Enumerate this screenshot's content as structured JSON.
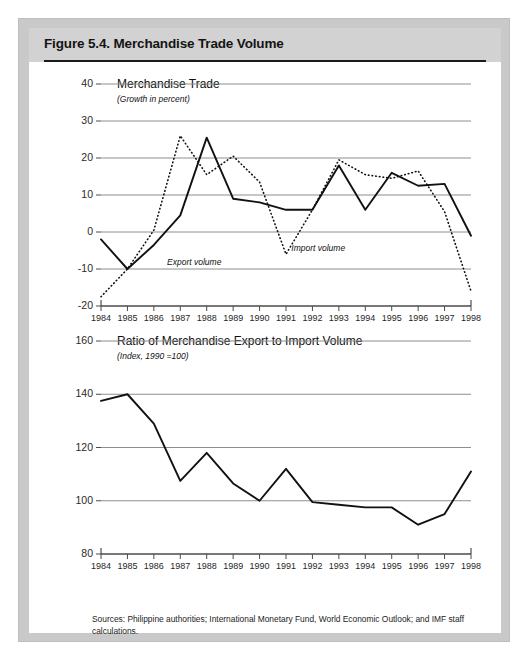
{
  "figure": {
    "title": "Figure 5.4.  Merchandise Trade Volume",
    "source_note": "Sources:  Philippine authorities; International Monetary Fund, World Economic Outlook; and IMF staff calculations."
  },
  "colors": {
    "frame": "#c9c9c9",
    "title_band": "#d2d2d2",
    "gridline": "#8e8e8e",
    "line": "#111111",
    "text": "#141414"
  },
  "chart_data": [
    {
      "type": "line",
      "id": "merchandise-trade",
      "title": "Merchandise Trade",
      "subtitle": "(Growth in percent)",
      "xlabel": "",
      "ylabel": "",
      "ylim": [
        -20,
        40
      ],
      "yticks": [
        40,
        30,
        20,
        10,
        0,
        -10,
        -20
      ],
      "grid": true,
      "legend_position": "inline-annotation",
      "categories": [
        1984,
        1985,
        1986,
        1987,
        1988,
        1989,
        1990,
        1991,
        1992,
        1993,
        1994,
        1995,
        1996,
        1997,
        1998
      ],
      "xtick_labels": [
        "1984",
        "1985",
        "1986",
        "1987",
        "1988",
        "1989",
        "1990",
        "1991",
        "1992",
        "1993",
        "1994",
        "1995",
        "1996",
        "1997",
        "1998"
      ],
      "series": [
        {
          "name": "Export volume",
          "style": "solid",
          "values": [
            -2.0,
            -10.0,
            -3.5,
            4.5,
            25.5,
            9.0,
            8.0,
            6.0,
            6.0,
            18.0,
            6.0,
            16.0,
            12.5,
            13.0,
            -1.0
          ]
        },
        {
          "name": "Import volume",
          "style": "dotted",
          "values": [
            -17.5,
            -10.0,
            0.5,
            26.0,
            15.5,
            20.5,
            13.5,
            -6.0,
            6.0,
            19.5,
            15.5,
            14.5,
            16.5,
            5.5,
            -16.0
          ]
        }
      ],
      "annotations": [
        {
          "text": "Export volume",
          "x": 1986.5,
          "y": -8.5
        },
        {
          "text": "Import volume",
          "x": 1991.2,
          "y": -4.5
        }
      ]
    },
    {
      "type": "line",
      "id": "ratio-export-import",
      "title": "Ratio of Merchandise Export to Import Volume",
      "subtitle": "(Index, 1990 =100)",
      "xlabel": "",
      "ylabel": "",
      "ylim": [
        80,
        160
      ],
      "yticks": [
        160,
        140,
        120,
        100,
        80
      ],
      "grid": true,
      "legend_position": "none",
      "categories": [
        1984,
        1985,
        1986,
        1987,
        1988,
        1989,
        1990,
        1991,
        1992,
        1993,
        1994,
        1995,
        1996,
        1997,
        1998
      ],
      "xtick_labels": [
        "1984",
        "1985",
        "1986",
        "1987",
        "1988",
        "1989",
        "1990",
        "1991",
        "1992",
        "1993",
        "1994",
        "1995",
        "1996",
        "1997",
        "1998"
      ],
      "series": [
        {
          "name": "Ratio of merchandise export to import volume",
          "style": "solid",
          "values": [
            137.5,
            140.0,
            129.0,
            107.5,
            118.0,
            106.5,
            100.0,
            112.0,
            99.5,
            98.5,
            97.5,
            97.5,
            91.0,
            95.0,
            111.0
          ]
        }
      ],
      "annotations": []
    }
  ]
}
